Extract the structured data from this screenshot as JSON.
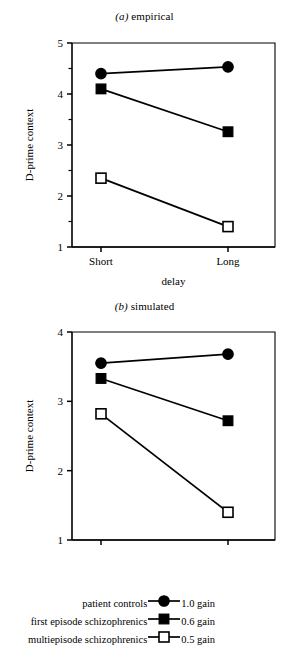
{
  "panels": {
    "a": {
      "title_label": "(a)",
      "title_text": "empirical",
      "ylabel": "D-prime context",
      "xlabel": "delay"
    },
    "b": {
      "title_label": "(b)",
      "title_text": "simulated",
      "ylabel": "D-prime context",
      "xlabel": "delay"
    }
  },
  "legend": {
    "rows": [
      {
        "name": "patient controls",
        "marker": "filled-circle",
        "gain": "1.0 gain"
      },
      {
        "name": "first episode schizophrenics",
        "marker": "filled-square",
        "gain": "0.6 gain"
      },
      {
        "name": "multiepisode schizophrenics",
        "marker": "open-square",
        "gain": "0.5 gain"
      }
    ]
  },
  "chart_data": [
    {
      "type": "line",
      "panel": "a",
      "title": "(a) empirical",
      "xlabel": "delay",
      "ylabel": "D-prime context",
      "categories": [
        "Short",
        "Long"
      ],
      "x_tick_labels": [
        "Short",
        "Long"
      ],
      "ylim": [
        1,
        5
      ],
      "yticks": [
        1,
        2,
        3,
        4,
        5
      ],
      "ytick_labels": [
        "1",
        "2",
        "3",
        "4",
        "5"
      ],
      "yminor_ticks": [
        1.5,
        2.5,
        3.5,
        4.5
      ],
      "grid": false,
      "legend_position": "below-figure",
      "series": [
        {
          "name": "patient controls",
          "marker": "filled-circle",
          "gain": "1.0 gain",
          "values": [
            4.4,
            4.53
          ]
        },
        {
          "name": "first episode schizophrenics",
          "marker": "filled-square",
          "gain": "0.6 gain",
          "values": [
            4.1,
            3.26
          ]
        },
        {
          "name": "multiepisode schizophrenics",
          "marker": "open-square",
          "gain": "0.5 gain",
          "values": [
            2.35,
            1.4
          ]
        }
      ]
    },
    {
      "type": "line",
      "panel": "b",
      "title": "(b) simulated",
      "xlabel": "delay",
      "ylabel": "D-prime context",
      "categories": [
        "Short",
        "Long"
      ],
      "x_tick_labels": [
        "Short",
        "Long"
      ],
      "ylim": [
        1,
        4
      ],
      "yticks": [
        1,
        2,
        3,
        4
      ],
      "ytick_labels": [
        "1",
        "2",
        "3",
        "4"
      ],
      "yminor_ticks": [],
      "grid": false,
      "legend_position": "below-figure",
      "series": [
        {
          "name": "patient controls",
          "marker": "filled-circle",
          "gain": "1.0 gain",
          "values": [
            3.55,
            3.68
          ]
        },
        {
          "name": "first episode schizophrenics",
          "marker": "filled-square",
          "gain": "0.6 gain",
          "values": [
            3.33,
            2.72
          ]
        },
        {
          "name": "multiepisode schizophrenics",
          "marker": "open-square",
          "gain": "0.5 gain",
          "values": [
            2.82,
            1.4
          ]
        }
      ]
    }
  ]
}
